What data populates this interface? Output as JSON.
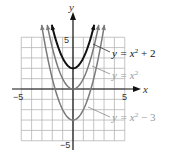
{
  "chart_data": {
    "type": "line",
    "title": "",
    "xlabel": "x",
    "ylabel": "y",
    "xlim": [
      -5,
      5
    ],
    "ylim": [
      -5,
      5
    ],
    "grid": true,
    "tick_labels": {
      "x_neg": "-5",
      "x_pos": "5",
      "y_pos": "5",
      "y_neg": "-5"
    },
    "series": [
      {
        "name": "y = x² + 2",
        "expr_main": "y = x",
        "exp": "2",
        "tail": " + 2",
        "shift": 2,
        "color": "#111111",
        "width": 2.0,
        "x": [
          -1.73,
          -1,
          0,
          1,
          1.73
        ],
        "y": [
          5,
          3,
          2,
          3,
          5
        ]
      },
      {
        "name": "y = x²",
        "expr_main": "y = x",
        "exp": "2",
        "tail": "",
        "shift": 0,
        "color": "#7a7a7a",
        "width": 1.5,
        "x": [
          -2.24,
          -2,
          -1,
          0,
          1,
          2,
          2.24
        ],
        "y": [
          5,
          4,
          1,
          0,
          1,
          4,
          5
        ]
      },
      {
        "name": "y = x² − 3",
        "expr_main": "y = x",
        "exp": "2",
        "tail": " − 3",
        "shift": -3,
        "color": "#7a7a7a",
        "width": 1.5,
        "x": [
          -2.83,
          -2,
          -1,
          0,
          1,
          2,
          2.83
        ],
        "y": [
          5,
          1,
          -2,
          -3,
          -2,
          1,
          5
        ]
      }
    ],
    "annotations": [
      "y = x² + 2",
      "y = x²",
      "y = x² − 3"
    ]
  },
  "labels": {
    "x_axis": "x",
    "y_axis": "y",
    "tick_x_neg": "−5",
    "tick_x_pos": "5",
    "tick_y_pos": "5",
    "tick_y_neg": "−5",
    "eq1_main": "y = x",
    "eq1_exp": "2",
    "eq1_tail": " + 2",
    "eq2_main": "y = x",
    "eq2_exp": "2",
    "eq3_main": "y = x",
    "eq3_exp": "2",
    "eq3_tail": " − 3"
  }
}
